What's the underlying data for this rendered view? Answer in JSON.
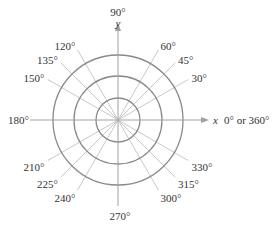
{
  "diagram": {
    "title": "",
    "center": {
      "x": 118,
      "y": 120
    },
    "circle_radii": [
      22,
      44,
      65
    ],
    "colors": {
      "circle": "#8a8a8a",
      "ray": "#c8c8c8",
      "axis": "#a0a0a0",
      "text": "#333333"
    },
    "axes": {
      "x_label": "x",
      "y_label": "y",
      "x_end_label": "0° or 360°",
      "y_end_label": "90°",
      "neg_x_label": "180°",
      "neg_y_label": "270°"
    },
    "angle_labels": [
      {
        "deg": 30,
        "text": "30°"
      },
      {
        "deg": 45,
        "text": "45°"
      },
      {
        "deg": 60,
        "text": "60°"
      },
      {
        "deg": 120,
        "text": "120°"
      },
      {
        "deg": 135,
        "text": "135°"
      },
      {
        "deg": 150,
        "text": "150°"
      },
      {
        "deg": 210,
        "text": "210°"
      },
      {
        "deg": 225,
        "text": "225°"
      },
      {
        "deg": 240,
        "text": "240°"
      },
      {
        "deg": 300,
        "text": "300°"
      },
      {
        "deg": 315,
        "text": "315°"
      },
      {
        "deg": 330,
        "text": "330°"
      }
    ]
  }
}
